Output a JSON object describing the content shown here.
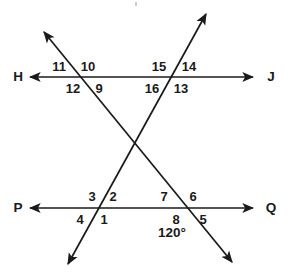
{
  "figure": {
    "width": 293,
    "height": 278,
    "background_color": "#ffffff",
    "stroke_color": "#1a1a1a",
    "text_color": "#1a1a1a"
  },
  "lines": [
    {
      "name": "line-HJ",
      "kind": "horizontal",
      "left_label": "H",
      "right_label": "J",
      "x1": 30,
      "y1": 77,
      "x2": 253,
      "y2": 77,
      "arrow_start": true,
      "arrow_end": true
    },
    {
      "name": "line-PQ",
      "kind": "horizontal",
      "left_label": "P",
      "right_label": "Q",
      "x1": 30,
      "y1": 208,
      "x2": 253,
      "y2": 208,
      "arrow_start": true,
      "arrow_end": true
    },
    {
      "name": "transversal-a",
      "kind": "diagonal",
      "x1": 44,
      "y1": 32,
      "x2": 232,
      "y2": 262,
      "arrow_start": true,
      "arrow_end": true
    },
    {
      "name": "transversal-b",
      "kind": "diagonal",
      "x1": 206,
      "y1": 14,
      "x2": 68,
      "y2": 264,
      "arrow_start": true,
      "arrow_end": true
    }
  ],
  "endpoint_labels": [
    {
      "name": "endpoint-label-H",
      "text": "H",
      "x": 18,
      "y": 77
    },
    {
      "name": "endpoint-label-J",
      "text": "J",
      "x": 271,
      "y": 77
    },
    {
      "name": "endpoint-label-P",
      "text": "P",
      "x": 18,
      "y": 208
    },
    {
      "name": "endpoint-label-Q",
      "text": "Q",
      "x": 271,
      "y": 208
    }
  ],
  "intersections": [
    {
      "name": "intersection-upper-left",
      "x": 85,
      "y": 77
    },
    {
      "name": "intersection-upper-right",
      "x": 168,
      "y": 77
    },
    {
      "name": "intersection-center",
      "x": 133,
      "y": 143
    },
    {
      "name": "intersection-lower-left",
      "x": 100,
      "y": 208
    },
    {
      "name": "intersection-lower-right",
      "x": 183,
      "y": 208
    }
  ],
  "angle_labels": [
    {
      "name": "angle-label-11",
      "text": "11",
      "x": 59,
      "y": 66,
      "at": "intersection-upper-left",
      "position": "upper-left"
    },
    {
      "name": "angle-label-10",
      "text": "10",
      "x": 88,
      "y": 66,
      "at": "intersection-upper-left",
      "position": "upper-right"
    },
    {
      "name": "angle-label-12",
      "text": "12",
      "x": 73,
      "y": 88,
      "at": "intersection-upper-left",
      "position": "lower-left"
    },
    {
      "name": "angle-label-9",
      "text": "9",
      "x": 99,
      "y": 88,
      "at": "intersection-upper-left",
      "position": "lower-right"
    },
    {
      "name": "angle-label-15",
      "text": "15",
      "x": 159,
      "y": 66,
      "at": "intersection-upper-right",
      "position": "upper-left"
    },
    {
      "name": "angle-label-14",
      "text": "14",
      "x": 189,
      "y": 66,
      "at": "intersection-upper-right",
      "position": "upper-right"
    },
    {
      "name": "angle-label-16",
      "text": "16",
      "x": 152,
      "y": 88,
      "at": "intersection-upper-right",
      "position": "lower-left"
    },
    {
      "name": "angle-label-13",
      "text": "13",
      "x": 181,
      "y": 88,
      "at": "intersection-upper-right",
      "position": "lower-right"
    },
    {
      "name": "angle-label-3",
      "text": "3",
      "x": 92,
      "y": 196,
      "at": "intersection-lower-left",
      "position": "upper-left"
    },
    {
      "name": "angle-label-2",
      "text": "2",
      "x": 113,
      "y": 196,
      "at": "intersection-lower-left",
      "position": "upper-right"
    },
    {
      "name": "angle-label-4",
      "text": "4",
      "x": 80,
      "y": 219,
      "at": "intersection-lower-left",
      "position": "lower-left"
    },
    {
      "name": "angle-label-1",
      "text": "1",
      "x": 104,
      "y": 219,
      "at": "intersection-lower-left",
      "position": "lower-right"
    },
    {
      "name": "angle-label-7",
      "text": "7",
      "x": 164,
      "y": 196,
      "at": "intersection-lower-right",
      "position": "upper-left"
    },
    {
      "name": "angle-label-6",
      "text": "6",
      "x": 193,
      "y": 196,
      "at": "intersection-lower-right",
      "position": "upper-right"
    },
    {
      "name": "angle-label-8",
      "text": "8",
      "x": 176,
      "y": 219,
      "at": "intersection-lower-right",
      "position": "lower-left"
    },
    {
      "name": "angle-label-5",
      "text": "5",
      "x": 203,
      "y": 219,
      "at": "intersection-lower-right",
      "position": "lower-right"
    }
  ],
  "measures": [
    {
      "name": "angle-measure-120",
      "text": "120°",
      "x": 172,
      "y": 233,
      "refers_to": "angle-label-8"
    }
  ]
}
